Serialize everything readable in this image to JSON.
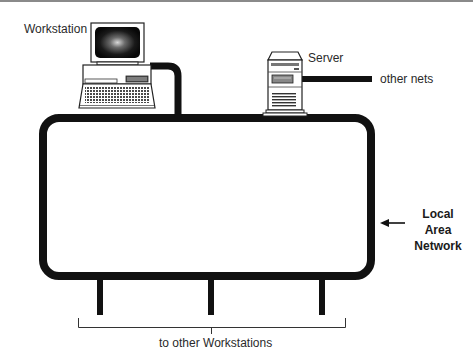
{
  "diagram": {
    "type": "network-topology",
    "title": "Local Area Network",
    "labels": {
      "workstation": "Workstation",
      "server": "Server",
      "other_nets": "other nets",
      "lan_line1": "Local",
      "lan_line2": "Area",
      "lan_line3": "Network",
      "other_workstations": "to other Workstations"
    },
    "nodes": [
      {
        "id": "workstation",
        "kind": "desktop-computer-icon",
        "label": "Workstation"
      },
      {
        "id": "server",
        "kind": "tower-server-icon",
        "label": "Server"
      },
      {
        "id": "other-nets",
        "kind": "external-link",
        "label": "other nets"
      },
      {
        "id": "drop-1",
        "kind": "cable-drop"
      },
      {
        "id": "drop-2",
        "kind": "cable-drop"
      },
      {
        "id": "drop-3",
        "kind": "cable-drop"
      }
    ],
    "edges": [
      {
        "from": "workstation",
        "to": "lan-loop"
      },
      {
        "from": "server",
        "to": "lan-loop"
      },
      {
        "from": "server",
        "to": "other-nets"
      },
      {
        "from": "lan-loop",
        "to": "drop-1"
      },
      {
        "from": "lan-loop",
        "to": "drop-2"
      },
      {
        "from": "lan-loop",
        "to": "drop-3"
      }
    ],
    "colors": {
      "line": "#111111",
      "text": "#2a2a2a",
      "background": "#ffffff",
      "rule": "#8a8a8a"
    }
  }
}
